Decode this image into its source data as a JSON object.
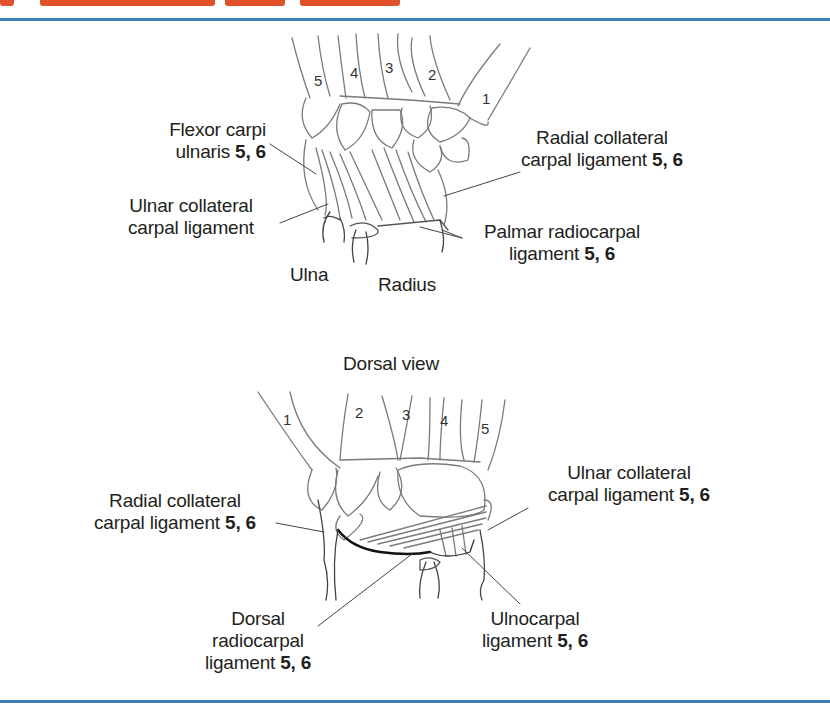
{
  "header": {
    "title_clipped": true,
    "title_color": "#e0502a",
    "rule_color": "#3a7fb5"
  },
  "palmar_view": {
    "digit_numbers": [
      "5",
      "4",
      "3",
      "2",
      "1"
    ],
    "labels": {
      "flexor_carpi_ulnaris": {
        "line1": "Flexor carpi",
        "line2": "ulnaris",
        "refs": "5, 6"
      },
      "ulnar_collateral": {
        "line1": "Ulnar collateral",
        "line2": "carpal ligament"
      },
      "radial_collateral": {
        "line1": "Radial collateral",
        "line2": "carpal ligament",
        "refs": "5, 6"
      },
      "palmar_radiocarpal": {
        "line1": "Palmar radiocarpal",
        "line2": "ligament",
        "refs": "5, 6"
      },
      "ulna": "Ulna",
      "radius": "Radius"
    }
  },
  "dorsal_view": {
    "title": "Dorsal view",
    "digit_numbers": [
      "1",
      "2",
      "3",
      "4",
      "5"
    ],
    "labels": {
      "radial_collateral": {
        "line1": "Radial collateral",
        "line2": "carpal ligament",
        "refs": "5, 6"
      },
      "ulnar_collateral": {
        "line1": "Ulnar collateral",
        "line2": "carpal ligament",
        "refs": "5, 6"
      },
      "dorsal_radiocarpal": {
        "line1": "Dorsal",
        "line2": "radiocarpal",
        "line3": "ligament",
        "refs": "5, 6"
      },
      "ulnocarpal": {
        "line1": "Ulnocarpal",
        "line2": "ligament",
        "refs": "5, 6"
      }
    }
  }
}
